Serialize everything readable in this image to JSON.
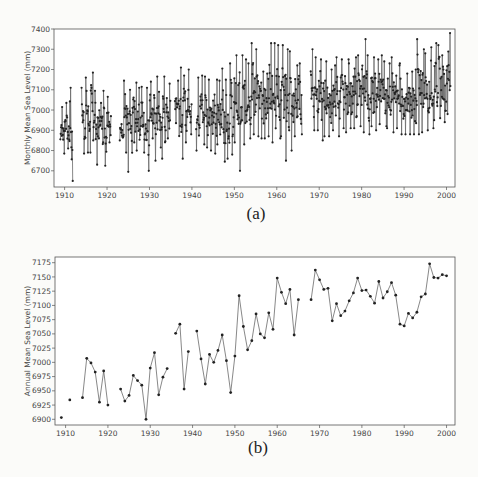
{
  "figure": {
    "caption_a": "(a)",
    "caption_b": "(b)"
  },
  "chart_data": [
    {
      "type": "line",
      "panel": "a",
      "title": "",
      "xlabel": "",
      "ylabel": "Monthly Mean Sea Level (mm)",
      "xlim": [
        1907.5,
        2002
      ],
      "ylim": [
        6620,
        7400
      ],
      "xticks": [
        1910,
        1920,
        1930,
        1940,
        1950,
        1960,
        1970,
        1980,
        1990,
        2000
      ],
      "yticks": [
        6700,
        6800,
        6900,
        7000,
        7100,
        7200,
        7300,
        7400
      ],
      "grid": false,
      "markers": true,
      "gaps": [
        [
          1911.9,
          1914.0
        ],
        [
          1920.9,
          1922.8
        ],
        [
          1934.9,
          1935.6
        ],
        [
          1939.5,
          1940.6
        ],
        [
          1965.6,
          1967.6
        ]
      ],
      "series": [
        {
          "name": "Monthly MSL",
          "note": "monthly values, approximate; seasonal oscillation ±~120 mm around annual mean with occasional dips to ~6650-6750",
          "years": [
            1909,
            1910,
            1911,
            1914,
            1915,
            1916,
            1917,
            1918,
            1919,
            1920,
            1923,
            1924,
            1925,
            1926,
            1927,
            1928,
            1929,
            1930,
            1931,
            1932,
            1933,
            1934,
            1936,
            1937,
            1938,
            1939,
            1941,
            1942,
            1943,
            1944,
            1945,
            1946,
            1947,
            1948,
            1949,
            1950,
            1951,
            1952,
            1953,
            1954,
            1955,
            1956,
            1957,
            1958,
            1959,
            1960,
            1961,
            1962,
            1963,
            1964,
            1965,
            1968,
            1969,
            1970,
            1971,
            1972,
            1973,
            1974,
            1975,
            1976,
            1977,
            1978,
            1979,
            1980,
            1981,
            1982,
            1983,
            1984,
            1985,
            1986,
            1987,
            1988,
            1989,
            1990,
            1991,
            1992,
            1993,
            1994,
            1995,
            1996,
            1997,
            1998,
            1999,
            2000
          ],
          "annual_max": [
            7015,
            7035,
            7110,
            7110,
            7160,
            7185,
            7095,
            7035,
            7095,
            7065,
            6930,
            7145,
            7100,
            7135,
            7110,
            7115,
            7110,
            7140,
            7165,
            7090,
            7165,
            7130,
            7145,
            7210,
            7170,
            7200,
            7160,
            7170,
            7165,
            7150,
            7150,
            7145,
            7205,
            7150,
            7230,
            7270,
            7270,
            7250,
            7230,
            7330,
            7300,
            7190,
            7180,
            7330,
            7330,
            7320,
            7320,
            7300,
            7290,
            7220,
            7230,
            7300,
            7260,
            7250,
            7240,
            7200,
            7220,
            7260,
            7250,
            7250,
            7230,
            7260,
            7270,
            7350,
            7270,
            7260,
            7250,
            7270,
            7240,
            7230,
            7260,
            7220,
            7230,
            7180,
            7190,
            7200,
            7350,
            7300,
            7280,
            7310,
            7330,
            7320,
            7270,
            7380
          ],
          "annual_min": [
            6785,
            6810,
            6650,
            6785,
            6790,
            6790,
            6730,
            6860,
            6725,
            6840,
            6850,
            6790,
            6695,
            6840,
            6800,
            6790,
            6700,
            6860,
            6750,
            6815,
            6760,
            6860,
            6935,
            6760,
            6840,
            6880,
            6800,
            6830,
            6815,
            6800,
            6785,
            6830,
            6745,
            6760,
            6780,
            6840,
            6700,
            6830,
            6860,
            6880,
            6870,
            6860,
            6860,
            6870,
            6840,
            6860,
            6870,
            6750,
            6800,
            6870,
            6880,
            6900,
            6900,
            6850,
            6870,
            6870,
            6900,
            6870,
            6910,
            6890,
            6910,
            6910,
            6920,
            6890,
            6880,
            6920,
            6900,
            6930,
            6920,
            6910,
            6890,
            6910,
            6880,
            6880,
            6880,
            6880,
            6880,
            6890,
            6900,
            6910,
            6950,
            6960,
            6940,
            6980
          ]
        }
      ]
    },
    {
      "type": "line",
      "panel": "b",
      "title": "",
      "xlabel": "",
      "ylabel": "Annual Mean Sea Level (mm)",
      "xlim": [
        1907.5,
        2002
      ],
      "ylim": [
        6890,
        7185
      ],
      "xticks": [
        1910,
        1920,
        1930,
        1940,
        1950,
        1960,
        1970,
        1980,
        1990,
        2000
      ],
      "yticks": [
        6900,
        6925,
        6950,
        6975,
        7000,
        7025,
        7050,
        7075,
        7100,
        7125,
        7150,
        7175
      ],
      "grid": false,
      "markers": true,
      "segments": [
        {
          "x": [
            1909
          ],
          "y": [
            6903
          ]
        },
        {
          "x": [
            1911
          ],
          "y": [
            6934
          ]
        },
        {
          "x": [
            1914,
            1915,
            1916,
            1917,
            1918,
            1919,
            1920
          ],
          "y": [
            6938,
            7007,
            6999,
            6983,
            6930,
            6985,
            6925
          ]
        },
        {
          "x": [
            1923,
            1924,
            1925,
            1926,
            1927,
            1928,
            1929,
            1930,
            1931,
            1932,
            1933,
            1934
          ],
          "y": [
            6953,
            6932,
            6942,
            6977,
            6968,
            6960,
            6900,
            6990,
            7017,
            6943,
            6974,
            6989
          ]
        },
        {
          "x": [
            1936,
            1937,
            1938,
            1939
          ],
          "y": [
            7051,
            7067,
            6953,
            7019
          ]
        },
        {
          "x": [
            1941,
            1942,
            1943,
            1944,
            1945,
            1946,
            1947,
            1948,
            1949,
            1950,
            1951,
            1952,
            1953,
            1954,
            1955,
            1956,
            1957,
            1958,
            1959,
            1960,
            1961,
            1962,
            1963,
            1964,
            1965
          ],
          "y": [
            7055,
            7006,
            6962,
            7014,
            7000,
            7021,
            7048,
            7003,
            6947,
            7011,
            7117,
            7063,
            7022,
            7038,
            7085,
            7050,
            7043,
            7087,
            7058,
            7148,
            7123,
            7103,
            7128,
            7048,
            7110
          ]
        },
        {
          "x": [
            1968,
            1969,
            1970,
            1971,
            1972,
            1973,
            1974,
            1975,
            1976,
            1977,
            1978,
            1979,
            1980,
            1981,
            1982,
            1983,
            1984,
            1985,
            1986,
            1987,
            1988,
            1989,
            1990,
            1991,
            1992,
            1993,
            1994,
            1995,
            1996,
            1997,
            1998,
            1999,
            2000
          ],
          "y": [
            7110,
            7162,
            7145,
            7128,
            7130,
            7073,
            7103,
            7082,
            7090,
            7108,
            7122,
            7148,
            7126,
            7127,
            7116,
            7104,
            7142,
            7113,
            7124,
            7140,
            7118,
            7067,
            7064,
            7086,
            7078,
            7088,
            7115,
            7120,
            7173,
            7149,
            7148,
            7154,
            7152
          ]
        }
      ]
    }
  ],
  "colors": {
    "line": "#6a6a6a",
    "marker": "#222222",
    "axes": "#555555",
    "background": "#fbfbf9"
  }
}
